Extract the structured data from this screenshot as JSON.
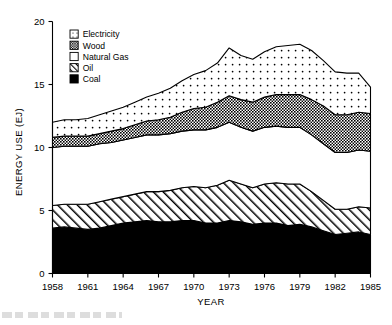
{
  "figure": {
    "title": "",
    "y_axis_title": "ENERGY USE (EJ)",
    "x_axis_title": "YEAR"
  },
  "legend": {
    "position": "top-left-inside",
    "entries": [
      {
        "label": "Electricity",
        "pattern": "sparse-dots",
        "swatch": "electricity-swatch"
      },
      {
        "label": "Wood",
        "pattern": "dense-checker",
        "swatch": "wood-swatch"
      },
      {
        "label": "Natural Gas",
        "pattern": "blank",
        "swatch": "natural-gas-swatch"
      },
      {
        "label": "Oil",
        "pattern": "diagonal-hatch",
        "swatch": "oil-swatch"
      },
      {
        "label": "Coal",
        "pattern": "solid-black",
        "swatch": "coal-swatch"
      }
    ]
  },
  "chart_data": {
    "type": "area",
    "stacked": true,
    "title": "",
    "xlabel": "YEAR",
    "ylabel": "ENERGY USE (EJ)",
    "xlim": [
      1958,
      1985
    ],
    "ylim": [
      0,
      20
    ],
    "yticks": [
      0,
      5,
      10,
      15,
      20
    ],
    "xticks": [
      1958,
      1961,
      1964,
      1967,
      1970,
      1973,
      1976,
      1979,
      1982,
      1985
    ],
    "grid": false,
    "legend_position": "upper left (inside axes)",
    "x": [
      1958,
      1959,
      1960,
      1961,
      1962,
      1963,
      1964,
      1965,
      1966,
      1967,
      1968,
      1969,
      1970,
      1971,
      1972,
      1973,
      1974,
      1975,
      1976,
      1977,
      1978,
      1979,
      1980,
      1981,
      1982,
      1983,
      1984,
      1985
    ],
    "series": [
      {
        "name": "Coal",
        "pattern": "solid-black",
        "values": [
          3.6,
          3.7,
          3.6,
          3.5,
          3.6,
          3.8,
          4.0,
          4.1,
          4.2,
          4.1,
          4.1,
          4.2,
          4.2,
          4.0,
          4.0,
          4.2,
          4.1,
          3.9,
          4.0,
          4.0,
          3.8,
          3.9,
          3.7,
          3.4,
          3.1,
          3.2,
          3.3,
          3.1
        ]
      },
      {
        "name": "Oil",
        "pattern": "diagonal-hatch",
        "values": [
          1.8,
          1.8,
          1.9,
          2.0,
          2.1,
          2.1,
          2.1,
          2.2,
          2.3,
          2.4,
          2.5,
          2.6,
          2.7,
          2.8,
          3.0,
          3.2,
          3.0,
          2.9,
          3.1,
          3.2,
          3.3,
          3.2,
          2.8,
          2.4,
          2.0,
          1.9,
          2.0,
          2.1
        ]
      },
      {
        "name": "Natural Gas",
        "pattern": "blank",
        "values": [
          4.6,
          4.6,
          4.6,
          4.6,
          4.6,
          4.5,
          4.5,
          4.5,
          4.5,
          4.5,
          4.5,
          4.5,
          4.5,
          4.6,
          4.6,
          4.6,
          4.5,
          4.5,
          4.5,
          4.5,
          4.5,
          4.5,
          4.5,
          4.5,
          4.5,
          4.5,
          4.5,
          4.5
        ]
      },
      {
        "name": "Wood",
        "pattern": "dense-checker",
        "values": [
          0.8,
          0.8,
          0.8,
          0.8,
          0.8,
          0.9,
          0.9,
          1.0,
          1.1,
          1.2,
          1.3,
          1.5,
          1.7,
          1.8,
          2.0,
          2.1,
          2.2,
          2.3,
          2.4,
          2.5,
          2.6,
          2.6,
          2.8,
          3.0,
          3.0,
          3.0,
          3.0,
          3.0
        ]
      },
      {
        "name": "Electricity",
        "pattern": "sparse-dots",
        "values": [
          1.2,
          1.3,
          1.3,
          1.4,
          1.5,
          1.6,
          1.7,
          1.8,
          1.9,
          2.1,
          2.3,
          2.5,
          2.7,
          2.9,
          3.1,
          3.8,
          3.5,
          3.4,
          3.6,
          3.8,
          3.9,
          4.0,
          3.9,
          3.6,
          3.4,
          3.3,
          3.1,
          2.1
        ]
      }
    ],
    "totals": [
      12.0,
      12.2,
      12.2,
      12.3,
      12.6,
      12.9,
      13.2,
      13.6,
      14.0,
      14.3,
      14.7,
      15.3,
      15.8,
      16.1,
      16.7,
      17.9,
      17.3,
      17.0,
      17.6,
      18.0,
      18.1,
      18.2,
      17.7,
      16.9,
      16.0,
      15.9,
      15.9,
      14.8
    ]
  }
}
